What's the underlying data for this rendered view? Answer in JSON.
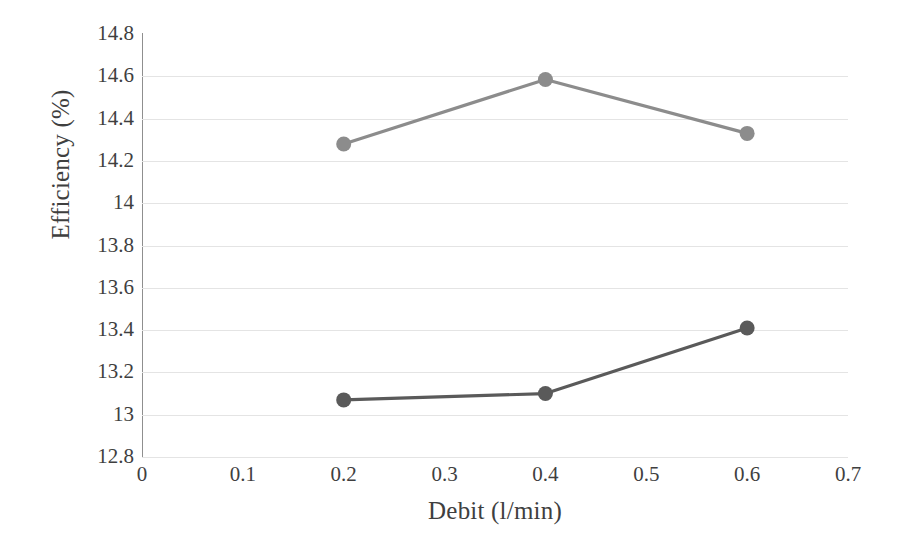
{
  "chart_data": {
    "type": "line",
    "title": "",
    "xlabel": "Debit (l/min)",
    "ylabel": "Efficiency (%)",
    "xlim": [
      0,
      0.7
    ],
    "ylim": [
      12.8,
      14.8
    ],
    "x_ticks": [
      "0",
      "0.1",
      "0.2",
      "0.3",
      "0.4",
      "0.5",
      "0.6",
      "0.7"
    ],
    "x_tick_values": [
      0,
      0.1,
      0.2,
      0.3,
      0.4,
      0.5,
      0.6,
      0.7
    ],
    "y_ticks": [
      "14.8",
      "14.6",
      "14.4",
      "14.2",
      "14",
      "13.8",
      "13.6",
      "13.4",
      "13.2",
      "13",
      "12.8"
    ],
    "y_tick_values": [
      14.8,
      14.6,
      14.4,
      14.2,
      14.0,
      13.8,
      13.6,
      13.4,
      13.2,
      13.0,
      12.8
    ],
    "grid": "horizontal",
    "legend": "none",
    "x": [
      0.2,
      0.4,
      0.6
    ],
    "series": [
      {
        "name": "upper-series",
        "color": "#8c8c8c",
        "marker": "circle",
        "values": [
          14.28,
          14.585,
          14.33
        ]
      },
      {
        "name": "lower-series",
        "color": "#5a5a5a",
        "marker": "circle",
        "values": [
          13.07,
          13.1,
          13.41
        ]
      }
    ]
  }
}
